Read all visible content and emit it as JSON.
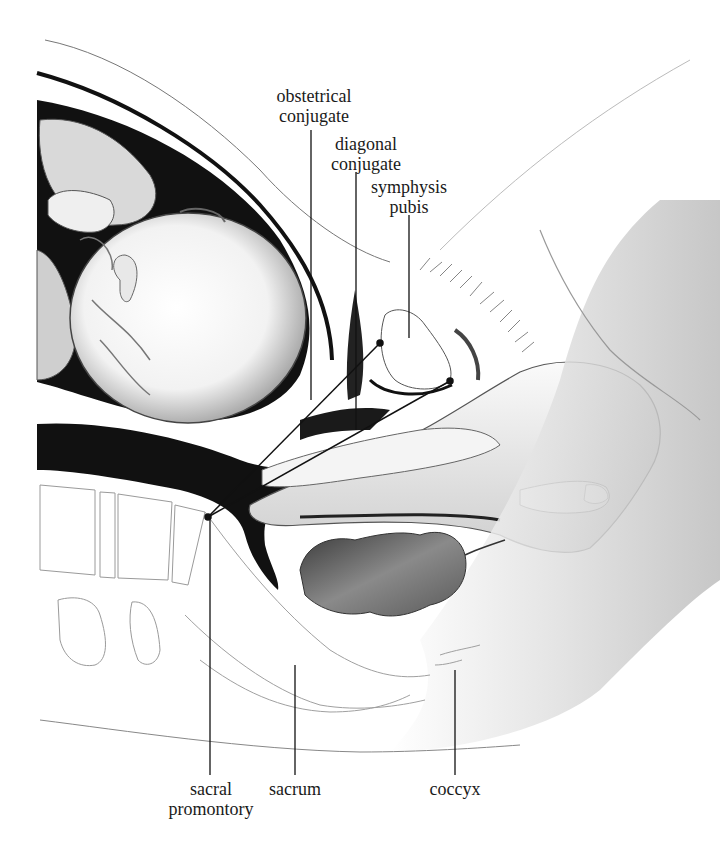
{
  "figure": {
    "type": "anatomical illustration",
    "colors": {
      "ink": "#111111",
      "shade": "#7a7a7a",
      "light_shade": "#c8c8c8",
      "background": "#ffffff"
    }
  },
  "labels": {
    "obstetrical_conjugate": {
      "line1": "obstetrical",
      "line2": "conjugate"
    },
    "diagonal_conjugate": {
      "line1": "diagonal",
      "line2": "conjugate"
    },
    "symphysis_pubis": {
      "line1": "symphysis",
      "line2": "pubis"
    },
    "sacral_promontory": {
      "line1": "sacral",
      "line2": "promontory"
    },
    "sacrum": {
      "line1": "sacrum"
    },
    "coccyx": {
      "line1": "coccyx"
    }
  }
}
